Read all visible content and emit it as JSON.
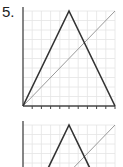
{
  "problem": {
    "number_label": "5."
  },
  "graphs": [
    {
      "id": "graph-1",
      "grid": {
        "x0": 23,
        "y0": 11,
        "x1": 115,
        "y1": 106,
        "cols": 10,
        "rows": 10
      },
      "triangle": {
        "left": [
          23,
          106
        ],
        "apex": [
          69,
          11
        ],
        "right": [
          115,
          106
        ]
      },
      "diagonal": {
        "from": [
          23,
          106
        ],
        "to": [
          115,
          11
        ]
      },
      "ticks": 10
    },
    {
      "id": "graph-2",
      "grid": {
        "x0": 23,
        "y0": 125,
        "x1": 115,
        "y1": 220,
        "cols": 10,
        "rows": 10
      },
      "triangle": {
        "left": [
          23,
          220
        ],
        "apex": [
          69,
          125
        ],
        "right": [
          115,
          220
        ]
      },
      "diagonal": {
        "from": [
          23,
          220
        ],
        "to": [
          115,
          125
        ]
      },
      "ticks": 10
    }
  ],
  "colors": {
    "grid": "#e4e4e4",
    "axis": "#444444",
    "triangle": "#333333",
    "diagonal": "#999999"
  }
}
